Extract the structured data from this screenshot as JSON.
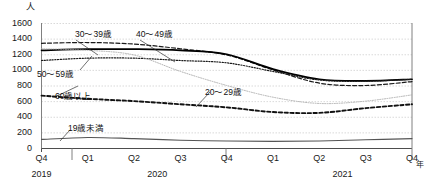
{
  "chart_data": {
    "type": "line",
    "title": "",
    "xlabel": "年",
    "ylabel": "人",
    "ylim": [
      0,
      1600
    ],
    "yticks": [
      0,
      200,
      400,
      600,
      800,
      1000,
      1200,
      1400,
      1600
    ],
    "grid": true,
    "legend_position": "inline-annotations",
    "x": [
      "Q4",
      "Q1",
      "Q2",
      "Q3",
      "Q4",
      "Q1",
      "Q2",
      "Q3",
      "Q4"
    ],
    "x_years": [
      {
        "label": "2019",
        "span": 1
      },
      {
        "label": "2020",
        "span": 4
      },
      {
        "label": "2021",
        "span": 4
      }
    ],
    "series": [
      {
        "name": "30～39歳",
        "style": "dashed",
        "color": "#1a1a1a",
        "values": [
          1340,
          1350,
          1330,
          1270,
          1190,
          1000,
          830,
          800,
          850
        ]
      },
      {
        "name": "40～49歳",
        "style": "solid",
        "color": "#000000",
        "values": [
          1250,
          1265,
          1265,
          1250,
          1200,
          1010,
          880,
          860,
          880
        ]
      },
      {
        "name": "50～59歳",
        "style": "dotted",
        "color": "#1a1a1a",
        "values": [
          1120,
          1150,
          1150,
          1120,
          1090,
          980,
          870,
          855,
          880
        ]
      },
      {
        "name": "20～29歳",
        "style": "fine-dotted",
        "color": "#aaaaaa",
        "values": [
          1270,
          1250,
          1190,
          980,
          800,
          650,
          570,
          600,
          680
        ]
      },
      {
        "name": "60歳以上",
        "style": "bold-dashed",
        "color": "#111111",
        "values": [
          670,
          630,
          600,
          560,
          520,
          460,
          450,
          510,
          560
        ]
      },
      {
        "name": "19歳未満",
        "style": "thin-solid",
        "color": "#555555",
        "values": [
          110,
          135,
          120,
          100,
          90,
          85,
          90,
          105,
          120
        ]
      }
    ],
    "annotations": [
      {
        "text": "30～39歳",
        "x": 75,
        "y": 30,
        "leader": [
          [
            76,
            40
          ],
          [
            98,
            55
          ]
        ]
      },
      {
        "text": "40～49歳",
        "x": 136,
        "y": 30,
        "leader": [
          [
            140,
            40
          ],
          [
            175,
            62
          ]
        ]
      },
      {
        "text": "50～59歳",
        "x": 37,
        "y": 70,
        "leader": [
          [
            80,
            70
          ],
          [
            92,
            56
          ]
        ]
      },
      {
        "text": "20～29歳",
        "x": 205,
        "y": 88,
        "leader": [
          [
            210,
            92
          ],
          [
            196,
            107
          ]
        ]
      },
      {
        "text": "60歳以上",
        "x": 55,
        "y": 92,
        "leader": [
          [
            57,
            96
          ],
          [
            78,
            86
          ]
        ]
      },
      {
        "text": "19歳未満",
        "x": 68,
        "y": 124,
        "leader": [
          [
            70,
            130
          ],
          [
            60,
            141
          ]
        ]
      }
    ]
  }
}
